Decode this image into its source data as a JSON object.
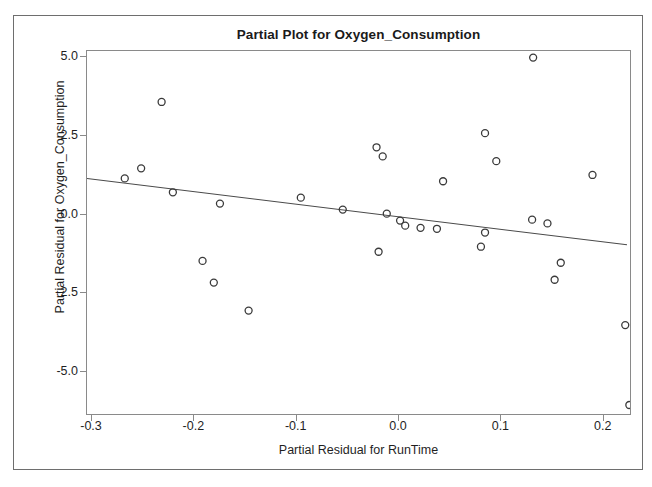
{
  "chart_data": {
    "type": "scatter",
    "title": "Partial Plot for Oxygen_Consumption",
    "xlabel": "Partial Residual for RunTime",
    "ylabel": "Partial Residual for Oxygen_Consumption",
    "xlim": [
      -0.3049,
      0.2276
    ],
    "ylim": [
      -6.4,
      5.2
    ],
    "xticks": [
      -0.3,
      -0.2,
      -0.1,
      0.0,
      0.1,
      0.2
    ],
    "xtick_labels": [
      "-0.3",
      "-0.2",
      "-0.1",
      "0.0",
      "0.1",
      "0.2"
    ],
    "yticks": [
      5.0,
      2.5,
      0.0,
      -2.5,
      -5.0
    ],
    "ytick_labels": [
      "5.0",
      "2.5",
      "0.0",
      "-2.5",
      "-5.0"
    ],
    "grid": false,
    "legend": false,
    "marker": "open-circle",
    "marker_color": "#3a3a3a",
    "fit_line": {
      "label": "linear fit",
      "color": "#4a4a4a",
      "x_start": -0.3049,
      "y_start": 1.15,
      "x_end": 0.2227,
      "y_end": -0.96,
      "slope": -4.0,
      "intercept": -0.065
    },
    "points": [
      {
        "x": -0.232,
        "y": 3.58
      },
      {
        "x": -0.268,
        "y": 1.15
      },
      {
        "x": -0.252,
        "y": 1.47
      },
      {
        "x": -0.221,
        "y": 0.71
      },
      {
        "x": -0.175,
        "y": 0.35
      },
      {
        "x": -0.192,
        "y": -1.47
      },
      {
        "x": -0.181,
        "y": -2.16
      },
      {
        "x": -0.147,
        "y": -3.05
      },
      {
        "x": -0.096,
        "y": 0.54
      },
      {
        "x": -0.022,
        "y": 2.14
      },
      {
        "x": -0.016,
        "y": 1.85
      },
      {
        "x": 0.043,
        "y": 1.06
      },
      {
        "x": -0.055,
        "y": 0.16
      },
      {
        "x": -0.012,
        "y": 0.03
      },
      {
        "x": 0.001,
        "y": -0.19
      },
      {
        "x": 0.006,
        "y": -0.35
      },
      {
        "x": 0.021,
        "y": -0.42
      },
      {
        "x": 0.037,
        "y": -0.45
      },
      {
        "x": -0.02,
        "y": -1.18
      },
      {
        "x": 0.131,
        "y": 4.99
      },
      {
        "x": 0.084,
        "y": 2.59
      },
      {
        "x": 0.095,
        "y": 1.7
      },
      {
        "x": 0.189,
        "y": 1.26
      },
      {
        "x": 0.13,
        "y": -0.16
      },
      {
        "x": 0.145,
        "y": -0.28
      },
      {
        "x": 0.084,
        "y": -0.57
      },
      {
        "x": 0.08,
        "y": -1.02
      },
      {
        "x": 0.158,
        "y": -1.53
      },
      {
        "x": 0.152,
        "y": -2.07
      },
      {
        "x": 0.221,
        "y": -3.51
      },
      {
        "x": 0.225,
        "y": -6.05
      }
    ]
  }
}
